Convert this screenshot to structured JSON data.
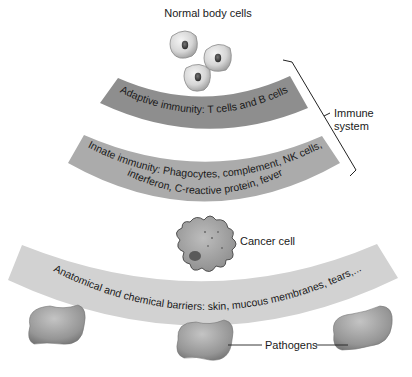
{
  "labels": {
    "normal_cells": "Normal body cells",
    "cancer_cell": "Cancer cell",
    "immune_system_line1": "Immune",
    "immune_system_line2": "system",
    "pathogens": "Pathogens"
  },
  "bands": {
    "adaptive": {
      "text": "Adaptive immunity: T cells and B cells",
      "color": "#8e8e8e"
    },
    "innate": {
      "line1": "Innate immunity: Phagocytes, complement, NK cells,",
      "line2": "interferon, C-reactive protein, fever",
      "color": "#ababab"
    },
    "barriers": {
      "text": "Anatomical and chemical barriers: skin, mucous membranes, tears,...",
      "color": "#d2d2d2"
    }
  },
  "colors": {
    "normal_cell_fill": "#d8d8d8",
    "cancer_cell_fill": "#a8a8a8",
    "pathogen_fill": "#9a9a9a",
    "line": "#222222"
  }
}
